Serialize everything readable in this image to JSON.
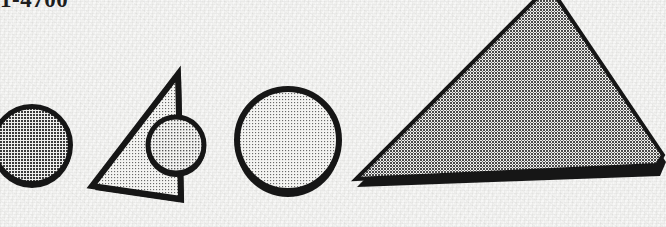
{
  "page": {
    "width": 666,
    "height": 227,
    "background_color": "#f1f1ef",
    "media": "scanned-halftone-print",
    "caption": {
      "text": "1-4700",
      "clipped_at_top": true,
      "color": "#1d1d1d"
    }
  },
  "palette": {
    "paper": "#f1f1ef",
    "ink_black": "#151515",
    "halftone_dark": "#8b8b8b",
    "halftone_mid": "#9b9b9b",
    "halftone_light": "#c8c8c8",
    "halftone_pale": "#d6d6d4"
  },
  "figure": {
    "title": "1-4700",
    "shape_count": 5,
    "shapes": [
      {
        "id": "circle-1",
        "name": "circle-left-clipped",
        "type": "circle",
        "cx": 32,
        "cy": 145,
        "r": 40,
        "fill": "#9b9b9b",
        "stroke": "#151515",
        "stroke_width": 5,
        "clipped_edge": "left",
        "order": 1
      },
      {
        "id": "triangle-1",
        "name": "triangle-with-inscribed-circle",
        "type": "triangle",
        "points": "178,74 92,186 181,199",
        "fill": "#d2d2d0",
        "stroke": "#151515",
        "stroke_width": 6,
        "order": 2
      },
      {
        "id": "circle-2",
        "name": "circle-on-triangle-edge",
        "type": "circle",
        "cx": 176,
        "cy": 145,
        "r": 29,
        "fill": "#9b9b9b",
        "stroke": "#151515",
        "stroke_width": 5,
        "overlaps": "triangle-1",
        "order": 3
      },
      {
        "id": "circle-3",
        "name": "circle-large-pale",
        "type": "circle",
        "cx": 288,
        "cy": 140,
        "r": 52,
        "fill": "#d2d2d0",
        "stroke": "#151515",
        "stroke_width": 6,
        "order": 4
      },
      {
        "id": "quad-1",
        "name": "quadrilateral-large-right",
        "type": "quadrilateral",
        "points": "549,-12 662,155 657,166 356,181",
        "fill": "#8f8f8f",
        "stroke": "#151515",
        "stroke_width": 4,
        "clipped_edge": "top-right",
        "order": 5
      }
    ]
  }
}
